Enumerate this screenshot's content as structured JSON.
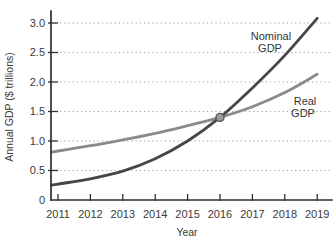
{
  "chart_data": {
    "type": "line",
    "title": "",
    "xlabel": "Year",
    "ylabel": "Annual GDP ($ trillions)",
    "x": [
      2011,
      2012,
      2013,
      2014,
      2015,
      2016,
      2017,
      2018,
      2019
    ],
    "x_tick_labels": [
      "2011",
      "2012",
      "2013",
      "2014",
      "2015",
      "2016",
      "2017",
      "2018",
      "2019"
    ],
    "y_ticks": [
      0,
      0.5,
      1,
      1.5,
      2,
      2.5,
      3
    ],
    "y_tick_labels": [
      "0",
      "0.5",
      "1.0",
      "1.5",
      "2.0",
      "2.5",
      "3.0"
    ],
    "xlim": [
      2010.8,
      2019.45
    ],
    "ylim": [
      0,
      3.25
    ],
    "grid": {
      "horizontal": true,
      "style": "dotted",
      "color": "#9c9c9c"
    },
    "axis_color": "#2e2e2e",
    "background_color": "#ffffff",
    "series": [
      {
        "name": "Nominal GDP",
        "label_lines": [
          "Nominal",
          "GDP"
        ],
        "color": "#45454c",
        "values": [
          0.27,
          0.36,
          0.49,
          0.7,
          1.0,
          1.4,
          1.9,
          2.45,
          3.08
        ]
      },
      {
        "name": "Real GDP",
        "label_lines": [
          "Real",
          "GDP"
        ],
        "color": "#8a8a8e",
        "values": [
          0.83,
          0.92,
          1.02,
          1.13,
          1.26,
          1.4,
          1.58,
          1.82,
          2.13
        ]
      }
    ],
    "annotations": [
      {
        "type": "point",
        "name": "nominal-real-intersection",
        "x": 2016,
        "y": 1.4,
        "fill": "#9b9b9f",
        "stroke": "#55555b"
      }
    ]
  }
}
